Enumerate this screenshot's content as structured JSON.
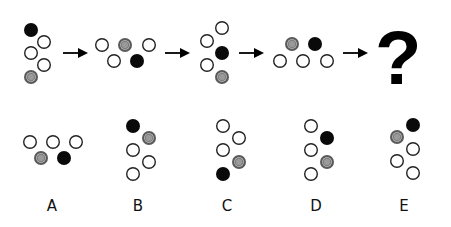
{
  "puzzle": {
    "type": "figure-sequence",
    "circle_radius": 7,
    "colors": {
      "white_fill": "#ffffff",
      "outline": "#222222",
      "black_fill": "#0a0a0a",
      "gray_outer": "#5a5a5a",
      "gray_inner": "#9a9a9a"
    },
    "sequence": [
      {
        "id": "fig1",
        "circles": [
          {
            "x": 31,
            "y": 30,
            "kind": "black"
          },
          {
            "x": 44,
            "y": 42,
            "kind": "white"
          },
          {
            "x": 31,
            "y": 53,
            "kind": "white"
          },
          {
            "x": 44,
            "y": 65,
            "kind": "white"
          },
          {
            "x": 31,
            "y": 77,
            "kind": "gray"
          }
        ]
      },
      {
        "id": "fig2",
        "circles": [
          {
            "x": 102,
            "y": 45,
            "kind": "white"
          },
          {
            "x": 125,
            "y": 45,
            "kind": "gray"
          },
          {
            "x": 149,
            "y": 45,
            "kind": "white"
          },
          {
            "x": 114,
            "y": 61,
            "kind": "white"
          },
          {
            "x": 137,
            "y": 61,
            "kind": "black"
          }
        ]
      },
      {
        "id": "fig3",
        "circles": [
          {
            "x": 222,
            "y": 28,
            "kind": "white"
          },
          {
            "x": 207,
            "y": 41,
            "kind": "white"
          },
          {
            "x": 222,
            "y": 53,
            "kind": "black"
          },
          {
            "x": 207,
            "y": 65,
            "kind": "white"
          },
          {
            "x": 222,
            "y": 77,
            "kind": "gray"
          }
        ]
      },
      {
        "id": "fig4",
        "circles": [
          {
            "x": 292,
            "y": 44,
            "kind": "gray"
          },
          {
            "x": 315,
            "y": 44,
            "kind": "black"
          },
          {
            "x": 280,
            "y": 61,
            "kind": "white"
          },
          {
            "x": 303,
            "y": 61,
            "kind": "white"
          },
          {
            "x": 327,
            "y": 61,
            "kind": "white"
          }
        ]
      }
    ],
    "arrows": [
      {
        "x1": 63,
        "x2": 88,
        "y": 53
      },
      {
        "x1": 165,
        "x2": 190,
        "y": 53
      },
      {
        "x1": 239,
        "x2": 264,
        "y": 53
      },
      {
        "x1": 343,
        "x2": 368,
        "y": 53
      }
    ],
    "question_mark": {
      "text": "?",
      "x": 375,
      "y": 84
    },
    "options": [
      {
        "label": "A",
        "label_x": 52,
        "label_y": 211,
        "circles": [
          {
            "x": 30,
            "y": 142,
            "kind": "white"
          },
          {
            "x": 53,
            "y": 142,
            "kind": "white"
          },
          {
            "x": 76,
            "y": 142,
            "kind": "white"
          },
          {
            "x": 41,
            "y": 158,
            "kind": "gray"
          },
          {
            "x": 64,
            "y": 158,
            "kind": "black"
          }
        ]
      },
      {
        "label": "B",
        "label_x": 138,
        "label_y": 211,
        "circles": [
          {
            "x": 133,
            "y": 126,
            "kind": "black"
          },
          {
            "x": 149,
            "y": 138,
            "kind": "gray"
          },
          {
            "x": 133,
            "y": 150,
            "kind": "white"
          },
          {
            "x": 149,
            "y": 162,
            "kind": "white"
          },
          {
            "x": 133,
            "y": 174,
            "kind": "white"
          }
        ]
      },
      {
        "label": "C",
        "label_x": 227,
        "label_y": 211,
        "circles": [
          {
            "x": 223,
            "y": 126,
            "kind": "white"
          },
          {
            "x": 239,
            "y": 138,
            "kind": "white"
          },
          {
            "x": 223,
            "y": 150,
            "kind": "white"
          },
          {
            "x": 239,
            "y": 162,
            "kind": "gray"
          },
          {
            "x": 223,
            "y": 174,
            "kind": "black"
          }
        ]
      },
      {
        "label": "D",
        "label_x": 316,
        "label_y": 211,
        "circles": [
          {
            "x": 311,
            "y": 126,
            "kind": "white"
          },
          {
            "x": 327,
            "y": 138,
            "kind": "black"
          },
          {
            "x": 311,
            "y": 150,
            "kind": "white"
          },
          {
            "x": 327,
            "y": 162,
            "kind": "gray"
          },
          {
            "x": 311,
            "y": 174,
            "kind": "white"
          }
        ]
      },
      {
        "label": "E",
        "label_x": 404,
        "label_y": 211,
        "circles": [
          {
            "x": 413,
            "y": 125,
            "kind": "black"
          },
          {
            "x": 397,
            "y": 137,
            "kind": "gray"
          },
          {
            "x": 413,
            "y": 149,
            "kind": "white"
          },
          {
            "x": 397,
            "y": 161,
            "kind": "white"
          },
          {
            "x": 413,
            "y": 173,
            "kind": "white"
          }
        ]
      }
    ]
  }
}
